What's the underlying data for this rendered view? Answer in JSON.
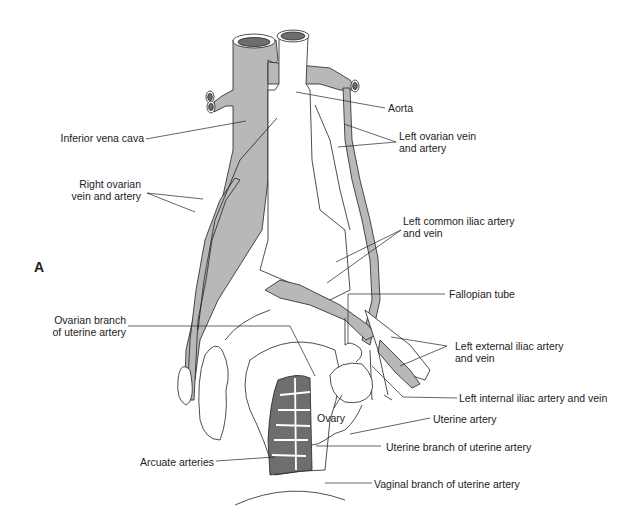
{
  "figure": {
    "panel_label": "A",
    "colors": {
      "vessel_fill": "#b8b8b8",
      "dark_fill": "#6e6e6e",
      "stroke": "#222222",
      "background": "#ffffff"
    }
  },
  "labels": {
    "inferior_vena_cava": "Inferior vena cava",
    "aorta": "Aorta",
    "left_ovarian_1": "Left ovarian vein",
    "left_ovarian_2": "and artery",
    "right_ovarian_1": "Right ovarian",
    "right_ovarian_2": "vein and artery",
    "left_common_iliac_1": "Left common iliac artery",
    "left_common_iliac_2": "and vein",
    "fallopian_tube": "Fallopian tube",
    "ovarian_branch_1": "Ovarian branch",
    "ovarian_branch_2": "of uterine artery",
    "left_external_iliac_1": "Left external iliac artery",
    "left_external_iliac_2": "and vein",
    "left_internal_iliac": "Left internal iliac artery and vein",
    "ovary": "Ovary",
    "uterine_artery": "Uterine artery",
    "uterine_branch": "Uterine branch of uterine artery",
    "arcuate_arteries": "Arcuate arteries",
    "vaginal_branch": "Vaginal branch of uterine artery"
  }
}
